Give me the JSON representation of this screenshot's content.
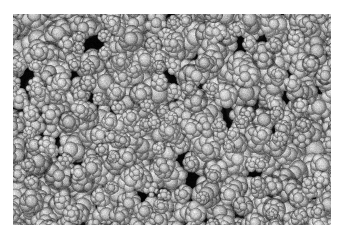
{
  "figure": {
    "kind": "micrograph",
    "modality": "scanning-electron-micrograph",
    "color_mode": "grayscale",
    "caption": "",
    "scale_bar_label": "",
    "annotation_text": ""
  },
  "canvas": {
    "width": 343,
    "height": 236,
    "background_color": "#ffffff"
  },
  "image_area": {
    "x": 13,
    "y": 14,
    "width": 318,
    "height": 211,
    "background_color": "#050505",
    "border_color": "#ffffff"
  },
  "palette": {
    "void_dark": "#060606",
    "particle_mid": "#8e8e8e",
    "particle_light": "#c8c8c8",
    "particle_highlight": "#e4e4e4",
    "particle_shadow": "#3a3a3a",
    "paper_white": "#ffffff"
  },
  "content_description": {
    "subject": "densely packed rounded particle agglomerates",
    "morphology": "cauliflower-like / floret clusters",
    "packing": "dense with irregular dark interstitial voids",
    "particle_diameter_px_min": 12,
    "particle_diameter_px_max": 34,
    "approx_particle_count": 520,
    "void_fraction": 0.26,
    "texture_grain": "fine speckled sub-grain texture on each agglomerate"
  },
  "render_params": {
    "seed": 20240517,
    "cluster_rows": 17,
    "cluster_cols": 25,
    "jitter": 0.52,
    "lobes_min": 5,
    "lobes_max": 9,
    "noise_opacity": 0.34,
    "blur_px": 0.45
  }
}
